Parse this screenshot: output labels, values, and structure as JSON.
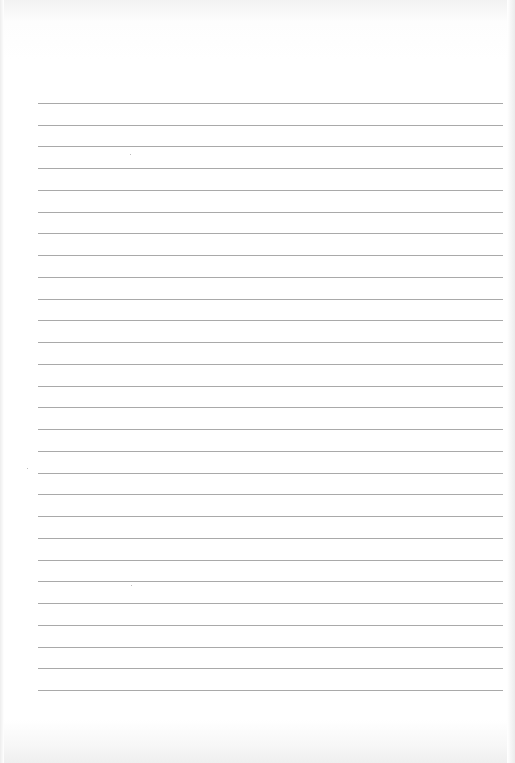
{
  "document": {
    "type": "lined-paper",
    "background_color": "#ffffff",
    "rule_color": "#9a9a9a",
    "rules": {
      "count": 28,
      "first_y": 103,
      "spacing": 21.74,
      "left_x": 38,
      "right_x": 503
    },
    "text_content": ""
  }
}
